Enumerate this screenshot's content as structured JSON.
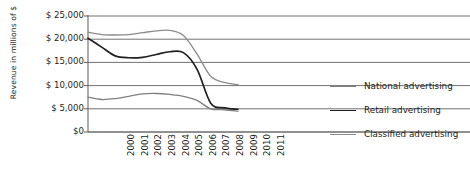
{
  "chart_data": {
    "type": "line",
    "title": "",
    "xlabel": "",
    "ylabel": "Revenue in millions of $",
    "categories": [
      "2000",
      "2001",
      "2002",
      "2003",
      "2004",
      "2005",
      "2006",
      "2007",
      "2008",
      "2009",
      "2010",
      "2011"
    ],
    "ylim": [
      0,
      25000
    ],
    "ytick_labels": [
      "$ 25,000",
      "$ 20,000",
      "$ 15,000",
      "$ 10,000",
      "$ 5,000",
      "$0"
    ],
    "ytick_values": [
      25000,
      20000,
      15000,
      10000,
      5000,
      0
    ],
    "grid": "horizontal",
    "legend_position": "right",
    "series": [
      {
        "name": "National advertising",
        "color": "#808080",
        "width": 1.3,
        "values": [
          7500,
          7000,
          7200,
          7700,
          8200,
          8300,
          8100,
          7700,
          6800,
          5000,
          4800,
          4500
        ]
      },
      {
        "name": "Retail advertising",
        "color": "#231f20",
        "width": 1.7,
        "values": [
          20200,
          18300,
          16400,
          16000,
          16100,
          16700,
          17300,
          17100,
          13500,
          6200,
          5200,
          4900
        ]
      },
      {
        "name": "Classified advertising",
        "color": "#8c8c8c",
        "width": 1.3,
        "values": [
          21500,
          21000,
          20900,
          21000,
          21400,
          21800,
          21900,
          20800,
          16800,
          12000,
          10700,
          10200
        ]
      }
    ]
  },
  "legend": {
    "items": [
      {
        "label": "National advertising"
      },
      {
        "label": "Retail advertising"
      },
      {
        "label": "Classified advertising"
      }
    ]
  }
}
